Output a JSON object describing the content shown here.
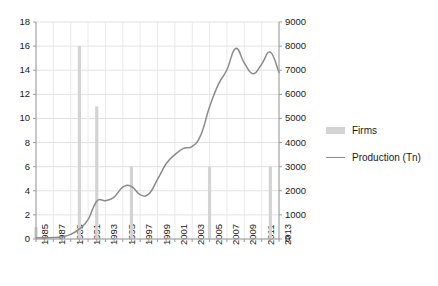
{
  "chart_data": {
    "type": "bar",
    "title": "",
    "subtitle": "",
    "xlabel": "",
    "ylabel": "",
    "grid": true,
    "legend_position": "right",
    "x": [
      1985,
      1986,
      1987,
      1988,
      1989,
      1990,
      1991,
      1992,
      1993,
      1994,
      1995,
      1996,
      1997,
      1998,
      1999,
      2000,
      2001,
      2002,
      2003,
      2004,
      2005,
      2006,
      2007,
      2008,
      2009,
      2010,
      2011,
      2012,
      2013
    ],
    "xtick_labels": [
      "1985",
      "1987",
      "1989",
      "1991",
      "1993",
      "1995",
      "1997",
      "1999",
      "2001",
      "2003",
      "2005",
      "2007",
      "2009",
      "2011",
      "2013"
    ],
    "left_axis": {
      "label": "Firms",
      "ylim": [
        0,
        18
      ],
      "ticks": [
        0,
        2,
        4,
        6,
        8,
        10,
        12,
        14,
        16,
        18
      ],
      "tick_labels": [
        "0",
        "2",
        "4",
        "6",
        "8",
        "10",
        "12",
        "14",
        "16",
        "18"
      ]
    },
    "right_axis": {
      "label": "Production (Tn)",
      "ylim": [
        0,
        9000
      ],
      "ticks": [
        0,
        1000,
        2000,
        3000,
        4000,
        5000,
        6000,
        7000,
        8000,
        9000
      ],
      "tick_labels": [
        "0",
        "1000",
        "2000",
        "3000",
        "4000",
        "5000",
        "6000",
        "7000",
        "8000",
        "9000"
      ]
    },
    "series": [
      {
        "name": "Firms",
        "type": "bar",
        "axis": "left",
        "color": "#d3d3d3",
        "values": [
          1,
          0,
          0,
          0,
          0,
          16,
          0,
          11,
          0,
          0,
          0,
          6,
          0,
          0,
          0,
          0,
          0,
          0,
          0,
          0,
          6,
          0,
          0,
          0,
          0,
          0,
          0,
          6,
          0
        ]
      },
      {
        "name": "Production (Tn)",
        "type": "line",
        "axis": "right",
        "color": "#8c8c8c",
        "values": [
          50,
          55,
          60,
          90,
          190,
          420,
          800,
          1570,
          1590,
          1740,
          2150,
          2180,
          1840,
          1870,
          2470,
          3120,
          3500,
          3760,
          3840,
          4320,
          5480,
          6400,
          7020,
          7900,
          7300,
          6850,
          7250,
          7750,
          6900
        ]
      }
    ],
    "legend": [
      {
        "label": "Firms",
        "marker": "bar-swatch",
        "color": "#d3d3d3"
      },
      {
        "label": "Production (Tn)",
        "marker": "line-swatch",
        "color": "#8c8c8c"
      }
    ]
  }
}
